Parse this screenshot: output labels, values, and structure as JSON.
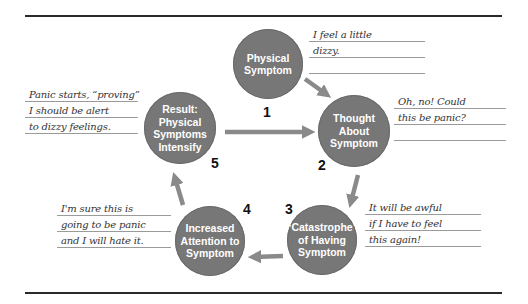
{
  "diagram": {
    "colors": {
      "circle_fill": "#777777",
      "arrow_fill": "#8a8a8a",
      "rule": "#2a2a2a",
      "note_line": "#9a9a9a"
    },
    "steps": [
      {
        "number": "1",
        "lines": [
          "Physical",
          "Symptom"
        ]
      },
      {
        "number": "2",
        "lines": [
          "Thought",
          "About",
          "Symptom"
        ]
      },
      {
        "number": "3",
        "lines": [
          "“Catastrophe”",
          "of Having",
          "Symptom"
        ]
      },
      {
        "number": "4",
        "lines": [
          "Increased",
          "Attention to",
          "Symptom"
        ]
      },
      {
        "number": "5",
        "lines": [
          "Result:",
          "Physical",
          "Symptoms",
          "Intensify"
        ]
      }
    ],
    "notes": [
      {
        "step": "1",
        "lines": [
          "I feel a little",
          "dizzy.",
          ""
        ]
      },
      {
        "step": "2",
        "lines": [
          "Oh, no! Could",
          "this be panic?",
          ""
        ]
      },
      {
        "step": "3",
        "lines": [
          "It will be awful",
          "if I have to feel",
          "this again!"
        ]
      },
      {
        "step": "4",
        "lines": [
          "I'm sure this is",
          "going to be panic",
          "and I will hate it."
        ]
      },
      {
        "step": "5",
        "lines": [
          "Panic starts, “proving”",
          "I should be alert",
          "to dizzy feelings."
        ]
      }
    ],
    "arrows": [
      {
        "from": "1",
        "to": "2"
      },
      {
        "from": "2",
        "to": "3"
      },
      {
        "from": "3",
        "to": "4"
      },
      {
        "from": "4",
        "to": "5"
      },
      {
        "from": "5",
        "to": "2"
      }
    ]
  }
}
